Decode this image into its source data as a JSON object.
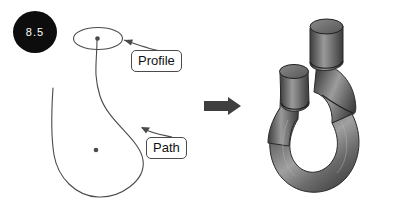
{
  "figure": {
    "number": "8.5",
    "kind": "cad-sweep-operation-figure",
    "background_color": "#ffffff",
    "width": 399,
    "height": 215
  },
  "badge": {
    "label": "8.5",
    "fill_color": "#0d0d0d",
    "text_color": "#ffffff",
    "name": "figure-number-badge"
  },
  "left_diagram": {
    "name": "wireframe-sweep-inputs",
    "line_color": "#4a4a4a",
    "profile": {
      "label": "Profile",
      "shape": "ellipse",
      "center_marker": "dot",
      "center": [
        97,
        38
      ],
      "radius_x": 25,
      "radius_y": 11
    },
    "path": {
      "label": "Path",
      "shape": "teardrop-loop",
      "center_marker": "dot",
      "center_dot": [
        96,
        150
      ]
    },
    "callouts": [
      {
        "label": "Profile",
        "points_to": "profile-ellipse"
      },
      {
        "label": "Path",
        "points_to": "path-curve"
      }
    ]
  },
  "transition": {
    "name": "result-arrow",
    "glyph": "right-arrow",
    "color": "#3f3f3f"
  },
  "right_model": {
    "name": "swept-solid-hook",
    "description": "U-shaped swept tube with two vertical cylindrical ends",
    "shading": "grayscale",
    "colors": {
      "tube_mid": "#6e6e6e",
      "tube_dark": "#3d3d3d",
      "tube_light": "#a8a8a8",
      "cap_fill": "#727272",
      "outline": "#2b2b2b"
    },
    "features": [
      "cylinder-end-tall",
      "cylinder-end-short",
      "bend-seam-line",
      "u-bend"
    ]
  }
}
